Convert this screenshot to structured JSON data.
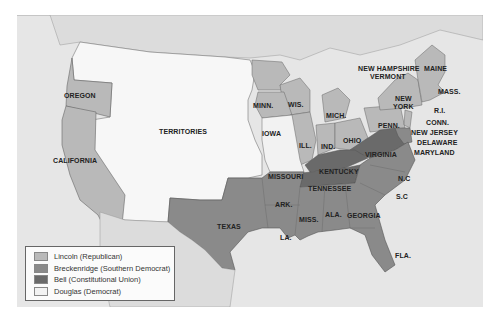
{
  "map": {
    "colors": {
      "background_water": "#e6e6e6",
      "lincoln": "#b9b9b9",
      "breckenridge": "#8a8a8a",
      "bell": "#6a6a6a",
      "douglas": "#f2f2f2",
      "territories": "#f7f7f7",
      "foreign_land": "#dcdcdc"
    },
    "labels": {
      "oregon": "OREGON",
      "california": "CALIFORNIA",
      "territories": "TERRITORIES",
      "texas": "TEXAS",
      "minn": "MINN.",
      "wis": "WIS.",
      "iowa": "IOWA",
      "mich": "MICH.",
      "ill": "ILL.",
      "ind": "IND.",
      "ohio": "OHIO",
      "penn": "PENN.",
      "new_york": "NEW\nYORK",
      "new_york_l1": "NEW",
      "new_york_l2": "YORK",
      "new_hampshire": "NEW HAMPSHIRE",
      "vermont": "VERMONT",
      "maine": "MAINE",
      "mass": "MASS.",
      "ri": "R.I.",
      "conn": "CONN.",
      "new_jersey": "NEW JERSEY",
      "delaware": "DELAWARE",
      "maryland": "MARYLAND",
      "virginia": "VIRGINIA",
      "kentucky": "KENTUCKY",
      "tennessee": "TENNESSEE",
      "missouri": "MISSOURI",
      "nc": "N.C",
      "sc": "S.C",
      "ark": "ARK.",
      "miss": "MISS.",
      "ala": "ALA.",
      "georgia": "GEORGIA",
      "la": "LA.",
      "fla": "FLA."
    }
  },
  "legend": {
    "items": [
      {
        "label": "Lincoln (Republican)",
        "color": "#b9b9b9"
      },
      {
        "label": "Breckenridge (Southern Democrat)",
        "color": "#8a8a8a"
      },
      {
        "label": "Bell (Constitutional Union)",
        "color": "#6a6a6a"
      },
      {
        "label": "Douglas (Democrat)",
        "color": "#f2f2f2"
      }
    ]
  }
}
